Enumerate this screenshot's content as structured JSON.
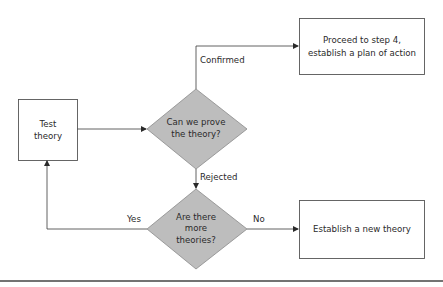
{
  "diagram": {
    "type": "flowchart",
    "nodes": {
      "test_theory": {
        "shape": "rectangle",
        "line1": "Test",
        "line2": "theory"
      },
      "can_prove": {
        "shape": "diamond",
        "line1": "Can we prove",
        "line2": "the theory?",
        "fill": "#bdbdbd"
      },
      "more_theories": {
        "shape": "diamond",
        "line1": "Are there",
        "line2": "more",
        "line3": "theories?",
        "fill": "#bdbdbd"
      },
      "proceed": {
        "shape": "rectangle",
        "line1": "Proceed to step 4,",
        "line2": "establish a plan of action"
      },
      "new_theory": {
        "shape": "rectangle",
        "line1": "Establish a new theory"
      }
    },
    "edges": {
      "test_to_prove": {
        "from": "Test theory",
        "to": "Can we prove the theory?",
        "label": ""
      },
      "confirmed": {
        "from": "Can we prove the theory?",
        "to": "Proceed to step 4, establish a plan of action",
        "label": "Confirmed"
      },
      "rejected": {
        "from": "Can we prove the theory?",
        "to": "Are there more theories?",
        "label": "Rejected"
      },
      "yes": {
        "from": "Are there more theories?",
        "to": "Test theory",
        "label": "Yes"
      },
      "no": {
        "from": "Are there more theories?",
        "to": "Establish a new theory",
        "label": "No"
      }
    },
    "colors": {
      "line": "#3a3a3a",
      "diamond_fill": "#bdbdbd",
      "box_border": "#555555",
      "rule": "#444444"
    }
  }
}
